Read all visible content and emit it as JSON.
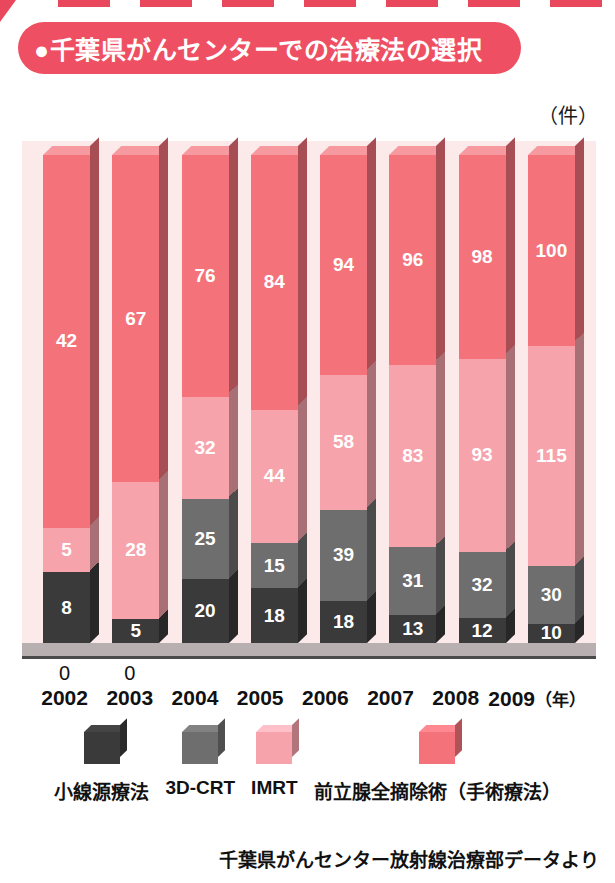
{
  "header": {
    "bullet": "●",
    "title": "千葉県がんセンターでの治療法の選択"
  },
  "chart": {
    "unit_label": "（件）",
    "source_note": "千葉県がんセンター放射線治療部データより"
  },
  "legend": {
    "items": [
      {
        "label": "小線源療法",
        "color": "#3a3a3a",
        "key": "brachytherapy"
      },
      {
        "label": "3D-CRT",
        "color": "#6e6e6e",
        "key": "3dcrt"
      },
      {
        "label": "IMRT",
        "color": "#f7a3ab",
        "key": "imrt"
      },
      {
        "label": "前立腺全摘除術（手術療法）",
        "color": "#f4737b",
        "key": "surgery"
      }
    ]
  },
  "chart_data": {
    "type": "bar",
    "subtype": "stacked-bar-3d",
    "title": "千葉県がんセンターでの治療法の選択",
    "xlabel": "（年）",
    "ylabel": "（件）",
    "grid": false,
    "legend_position": "bottom",
    "categories": [
      "2002",
      "2003",
      "2004",
      "2005",
      "2006",
      "2007",
      "2008",
      "2009"
    ],
    "series": [
      {
        "name": "小線源療法",
        "color": "#3a3a3a",
        "values": [
          8,
          5,
          20,
          18,
          18,
          13,
          12,
          10
        ]
      },
      {
        "name": "3D-CRT",
        "color": "#6e6e6e",
        "values": [
          0,
          0,
          25,
          15,
          39,
          31,
          32,
          30
        ]
      },
      {
        "name": "IMRT",
        "color": "#f7a3ab",
        "values": [
          5,
          28,
          32,
          44,
          58,
          83,
          93,
          115
        ]
      },
      {
        "name": "前立腺全摘除術（手術療法）",
        "color": "#f4737b",
        "values": [
          42,
          67,
          76,
          84,
          94,
          96,
          98,
          100
        ]
      }
    ],
    "totals": [
      55,
      100,
      153,
      161,
      209,
      223,
      235,
      255
    ],
    "x_tick_labels": [
      "2002",
      "2003",
      "2004",
      "2005",
      "2006",
      "2007",
      "2008",
      "2009"
    ],
    "x_axis_suffix": "（年）",
    "zero_annotations": {
      "2002": "0",
      "2003": "0"
    },
    "normalized": true,
    "note": "bars drawn to equal height (100% stacked); segment labels are absolute case counts"
  },
  "colors": {
    "banner": "#ef4f63",
    "plot_background": "#fce9ea",
    "floor": "#b8b0b0",
    "axis": "#4a4a4a",
    "surgery": "#f4737b",
    "imrt": "#f7a3ab",
    "crt": "#6e6e6e",
    "brachy": "#3a3a3a"
  }
}
